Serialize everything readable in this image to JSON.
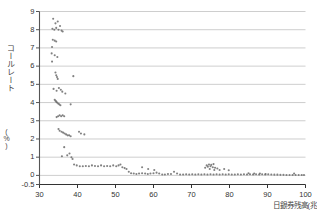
{
  "chart_data": {
    "type": "scatter",
    "title": "",
    "xlabel": "日銀券残高(兆",
    "ylabel": "コールレート",
    "ylabel_unit": "(%)",
    "xlim": [
      30,
      100
    ],
    "ylim": [
      -0.5,
      9
    ],
    "xticks": [
      30,
      40,
      50,
      60,
      70,
      80,
      90,
      100
    ],
    "yticks": [
      -0.5,
      0,
      1,
      2,
      3,
      4,
      5,
      6,
      7,
      8,
      9
    ],
    "ytick_labels": [
      "-0.5",
      "0",
      "1",
      "2",
      "3",
      "4",
      "5",
      "6",
      "7",
      "8",
      "9"
    ],
    "xtick_labels": [
      "30",
      "40",
      "50",
      "60",
      "70",
      "80",
      "90",
      "100"
    ],
    "grid": true,
    "grid_axis": "y",
    "marker_color": "#6b6b6b",
    "axis_color": "#555555",
    "grid_color": "#b9b9b9",
    "series": [
      {
        "name": "call rate vs banknote balance",
        "points": [
          [
            33.6,
            8.6
          ],
          [
            34.2,
            8.35
          ],
          [
            34.8,
            8.45
          ],
          [
            35.4,
            8.2
          ],
          [
            33.4,
            8.05
          ],
          [
            33.9,
            8.0
          ],
          [
            34.4,
            8.1
          ],
          [
            35.0,
            8.0
          ],
          [
            35.8,
            7.95
          ],
          [
            36.1,
            7.9
          ],
          [
            33.5,
            7.45
          ],
          [
            34.0,
            7.4
          ],
          [
            34.4,
            7.35
          ],
          [
            33.3,
            7.05
          ],
          [
            33.2,
            6.7
          ],
          [
            34.0,
            6.6
          ],
          [
            33.3,
            6.25
          ],
          [
            34.7,
            6.5
          ],
          [
            34.2,
            5.65
          ],
          [
            34.4,
            5.5
          ],
          [
            34.6,
            5.4
          ],
          [
            34.8,
            5.3
          ],
          [
            38.9,
            5.45
          ],
          [
            33.7,
            4.75
          ],
          [
            34.5,
            4.65
          ],
          [
            35.1,
            4.8
          ],
          [
            35.6,
            4.7
          ],
          [
            36.0,
            4.6
          ],
          [
            36.8,
            4.5
          ],
          [
            34.0,
            4.15
          ],
          [
            34.2,
            4.1
          ],
          [
            34.4,
            4.05
          ],
          [
            34.6,
            4.0
          ],
          [
            34.9,
            3.95
          ],
          [
            35.2,
            3.9
          ],
          [
            35.5,
            3.85
          ],
          [
            38.2,
            3.9
          ],
          [
            34.5,
            3.2
          ],
          [
            34.9,
            3.25
          ],
          [
            35.3,
            3.3
          ],
          [
            35.7,
            3.25
          ],
          [
            36.1,
            3.3
          ],
          [
            36.5,
            3.25
          ],
          [
            35.0,
            2.55
          ],
          [
            35.3,
            2.45
          ],
          [
            35.8,
            2.4
          ],
          [
            36.2,
            2.35
          ],
          [
            36.6,
            2.3
          ],
          [
            37.0,
            2.25
          ],
          [
            37.4,
            2.2
          ],
          [
            37.8,
            2.2
          ],
          [
            38.2,
            2.15
          ],
          [
            40.4,
            2.4
          ],
          [
            40.9,
            2.3
          ],
          [
            41.8,
            2.25
          ],
          [
            36.5,
            1.55
          ],
          [
            35.9,
            1.05
          ],
          [
            37.3,
            1.1
          ],
          [
            37.9,
            1.2
          ],
          [
            38.4,
            1.0
          ],
          [
            38.7,
            0.9
          ],
          [
            39.1,
            0.6
          ],
          [
            39.8,
            0.55
          ],
          [
            40.6,
            0.5
          ],
          [
            41.4,
            0.5
          ],
          [
            42.2,
            0.52
          ],
          [
            43.0,
            0.5
          ],
          [
            43.8,
            0.55
          ],
          [
            44.6,
            0.52
          ],
          [
            45.4,
            0.5
          ],
          [
            46.2,
            0.55
          ],
          [
            47.0,
            0.5
          ],
          [
            47.8,
            0.52
          ],
          [
            48.6,
            0.5
          ],
          [
            49.4,
            0.55
          ],
          [
            50.2,
            0.5
          ],
          [
            50.8,
            0.55
          ],
          [
            51.3,
            0.6
          ],
          [
            51.8,
            0.45
          ],
          [
            52.4,
            0.4
          ],
          [
            52.9,
            0.35
          ],
          [
            53.5,
            0.2
          ],
          [
            54.1,
            0.12
          ],
          [
            54.8,
            0.1
          ],
          [
            55.5,
            0.08
          ],
          [
            56.2,
            0.1
          ],
          [
            57.0,
            0.12
          ],
          [
            57.8,
            0.1
          ],
          [
            58.5,
            0.08
          ],
          [
            59.2,
            0.1
          ],
          [
            60.0,
            0.12
          ],
          [
            60.8,
            0.15
          ],
          [
            61.5,
            0.1
          ],
          [
            62.3,
            0.05
          ],
          [
            63.0,
            0.05
          ],
          [
            63.8,
            0.08
          ],
          [
            64.6,
            0.08
          ],
          [
            57.0,
            0.45
          ],
          [
            58.6,
            0.35
          ],
          [
            60.2,
            0.3
          ],
          [
            65.4,
            0.2
          ],
          [
            66.2,
            0.1
          ],
          [
            67.0,
            0.05
          ],
          [
            67.8,
            0.05
          ],
          [
            68.6,
            0.06
          ],
          [
            69.4,
            0.05
          ],
          [
            70.2,
            0.06
          ],
          [
            71.0,
            0.05
          ],
          [
            71.8,
            0.06
          ],
          [
            72.6,
            0.05
          ],
          [
            73.4,
            0.06
          ],
          [
            74.2,
            0.05
          ],
          [
            75.0,
            0.06
          ],
          [
            75.8,
            0.05
          ],
          [
            76.6,
            0.06
          ],
          [
            77.4,
            0.05
          ],
          [
            78.2,
            0.06
          ],
          [
            79.0,
            0.05
          ],
          [
            79.8,
            0.06
          ],
          [
            80.6,
            0.05
          ],
          [
            74.0,
            0.55
          ],
          [
            74.6,
            0.6
          ],
          [
            75.2,
            0.58
          ],
          [
            75.8,
            0.62
          ],
          [
            74.3,
            0.48
          ],
          [
            75.0,
            0.5
          ],
          [
            75.6,
            0.45
          ],
          [
            76.2,
            0.42
          ],
          [
            76.8,
            0.38
          ],
          [
            77.4,
            0.3
          ],
          [
            73.6,
            0.42
          ],
          [
            74.8,
            0.35
          ],
          [
            76.0,
            0.3
          ],
          [
            78.6,
            0.35
          ],
          [
            79.8,
            0.28
          ],
          [
            81.4,
            0.05
          ],
          [
            82.2,
            0.06
          ],
          [
            83.0,
            0.05
          ],
          [
            83.8,
            0.06
          ],
          [
            84.6,
            0.05
          ],
          [
            85.4,
            0.06
          ],
          [
            86.2,
            0.05
          ],
          [
            87.0,
            0.06
          ],
          [
            87.8,
            0.05
          ],
          [
            88.6,
            0.06
          ],
          [
            89.4,
            0.05
          ],
          [
            90.2,
            0.06
          ],
          [
            91.0,
            0.05
          ],
          [
            91.8,
            0.04
          ],
          [
            92.6,
            0.04
          ],
          [
            93.4,
            0.03
          ],
          [
            94.2,
            0.03
          ],
          [
            95.0,
            0.02
          ],
          [
            95.8,
            0.02
          ],
          [
            96.6,
            0.02
          ],
          [
            97.4,
            0.02
          ],
          [
            98.2,
            0.02
          ],
          [
            99.0,
            0.02
          ],
          [
            99.6,
            0.02
          ],
          [
            85.0,
            0.12
          ],
          [
            86.5,
            0.1
          ],
          [
            88.0,
            0.1
          ],
          [
            89.5,
            0.08
          ],
          [
            97.0,
            0.1
          ]
        ]
      }
    ]
  }
}
